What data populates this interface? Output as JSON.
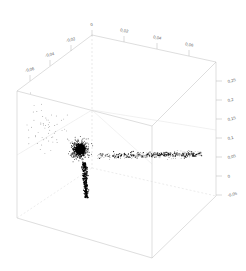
{
  "chart_data": {
    "type": "scatter",
    "title": "",
    "subtitle": "",
    "projection": "3d-wireframe-cube",
    "xlabel": "",
    "ylabel": "",
    "zlabel": "",
    "grid": true,
    "legend": null,
    "decimal_separator": ",",
    "axes": {
      "x": {
        "name": "x-axis-top-left",
        "tick_labels": [
          "-0,06",
          "-0,04",
          "-0,02",
          "0"
        ],
        "tick_values": [
          -0.06,
          -0.04,
          -0.02,
          0
        ],
        "range": [
          -0.07,
          0.01
        ]
      },
      "y": {
        "name": "y-axis-top-right",
        "tick_labels": [
          "0,02",
          "0,04",
          "0,06"
        ],
        "tick_values": [
          0.02,
          0.04,
          0.06
        ],
        "range": [
          0.0,
          0.07
        ]
      },
      "z": {
        "name": "z-axis-right-vertical",
        "tick_labels": [
          "0,25",
          "0,2",
          "0,15",
          "0,1",
          "0,05",
          "0",
          "-0,05"
        ],
        "tick_values": [
          0.25,
          0.2,
          0.15,
          0.1,
          0.05,
          0,
          -0.05
        ],
        "range": [
          -0.05,
          0.27
        ]
      }
    },
    "marker": {
      "shape": "dot",
      "color": "#000000",
      "size": 1
    },
    "clusters": [
      {
        "name": "dense-core-cluster",
        "description": "dense black blob near center-left of cube interior",
        "center_px": [
          80,
          150
        ],
        "point_count": 900
      },
      {
        "name": "vertical-tail",
        "description": "narrow dark streak descending from core cluster",
        "center_px": [
          84,
          178
        ],
        "point_count": 220
      },
      {
        "name": "horizontal-band",
        "description": "sparse scatter spreading rightward along a horizontal band",
        "center_px": [
          150,
          156
        ],
        "point_count": 420
      },
      {
        "name": "sparse-left-field",
        "description": "isolated sparse points left and above the core",
        "center_px": [
          50,
          130
        ],
        "point_count": 60
      }
    ],
    "total_points": 1600
  },
  "cube": {
    "name": "wireframe-bounding-box",
    "edge_color": "#b9b9b9",
    "gridline_color": "#cfcfcf",
    "vertices_px": {
      "top_back": [
        92,
        35
      ],
      "top_left": [
        17,
        91
      ],
      "top_right": [
        216,
        62
      ],
      "top_front": [
        152,
        126
      ],
      "bottom_back": [
        92,
        168
      ],
      "bottom_left": [
        17,
        218
      ],
      "bottom_right": [
        216,
        196
      ],
      "bottom_front": [
        152,
        258
      ]
    }
  }
}
